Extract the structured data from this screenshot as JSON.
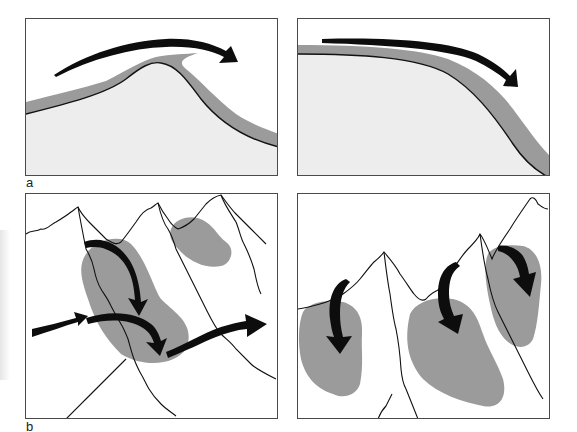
{
  "figure": {
    "labels": {
      "a": "a",
      "b": "b"
    },
    "colors": {
      "snow_layer": "#9b9b9b",
      "ground": "#ededed",
      "outline": "#111111",
      "arrow": "#0d0d0d",
      "border": "#4a4a4a"
    },
    "panels": [
      {
        "id": "a-left",
        "description": "Wind flows over a ridge crest, depositing a snow cornice on the lee side"
      },
      {
        "id": "a-right",
        "description": "Wind flows along a convex slope, snow layer thickens downslope"
      },
      {
        "id": "b-left",
        "description": "Mountain ridges with cross-loading wind arrows depositing snow patches in gullies"
      },
      {
        "id": "b-right",
        "description": "Mountain ridges with top-loading wind arrows depositing snow on lee slopes"
      }
    ]
  }
}
